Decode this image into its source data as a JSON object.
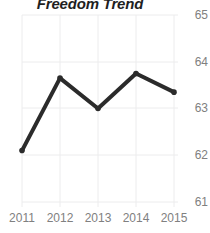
{
  "chart_data": {
    "type": "line",
    "title": "Freedom Trend",
    "xlabel": "",
    "ylabel": "",
    "categories": [
      "2011",
      "2012",
      "2013",
      "2014",
      "2015"
    ],
    "x": [
      2011,
      2012,
      2013,
      2014,
      2015
    ],
    "values": [
      62.1,
      63.65,
      63.0,
      63.75,
      63.35
    ],
    "series": [
      {
        "name": "Freedom Trend",
        "values": [
          62.1,
          63.65,
          63.0,
          63.75,
          63.35
        ],
        "color": "#2b2b2b"
      }
    ],
    "ylim": [
      61,
      65
    ],
    "yticks": [
      61,
      62,
      63,
      64,
      65
    ],
    "ytick_labels": [
      "61",
      "62",
      "63",
      "64",
      "65"
    ],
    "xticks": [
      2011,
      2012,
      2013,
      2014,
      2015
    ],
    "xtick_labels": [
      "2011",
      "2012",
      "2013",
      "2014",
      "2015"
    ],
    "grid": true,
    "grid_color": "#ececed",
    "y_axis_position": "right",
    "legend": false,
    "legend_position": "none",
    "marker": "circle",
    "line_width": 4,
    "tick_label_color": "#808080",
    "title_color": "#1f1f1f",
    "background": "#ffffff"
  }
}
